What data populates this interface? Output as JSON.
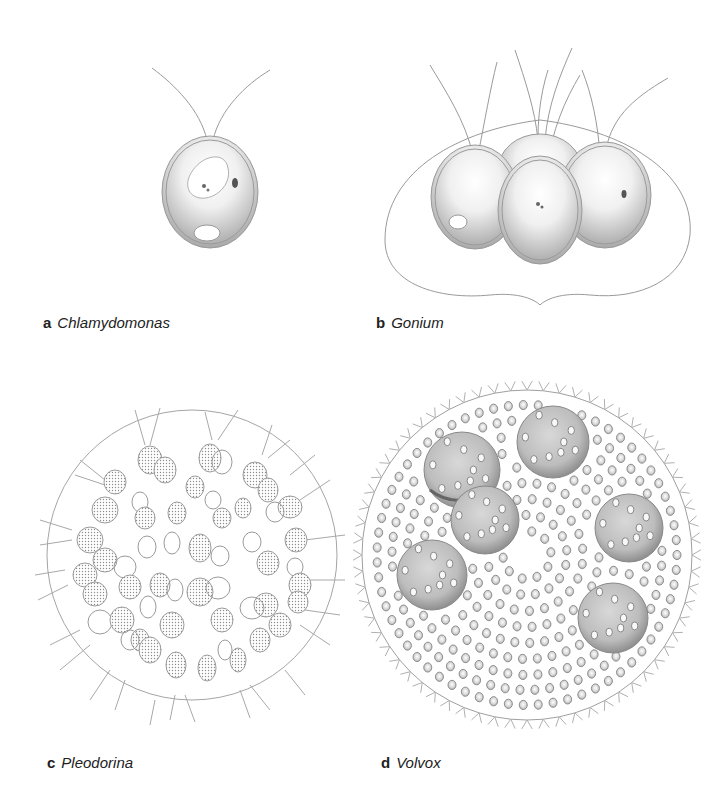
{
  "panels": [
    {
      "letter": "a",
      "name": "Chlamydomonas"
    },
    {
      "letter": "b",
      "name": "Gonium"
    },
    {
      "letter": "c",
      "name": "Pleodorina"
    },
    {
      "letter": "d",
      "name": "Volvox"
    }
  ],
  "colors": {
    "line": "#9a9a9a",
    "shade": "#8a8a8a",
    "label": "#222222"
  }
}
